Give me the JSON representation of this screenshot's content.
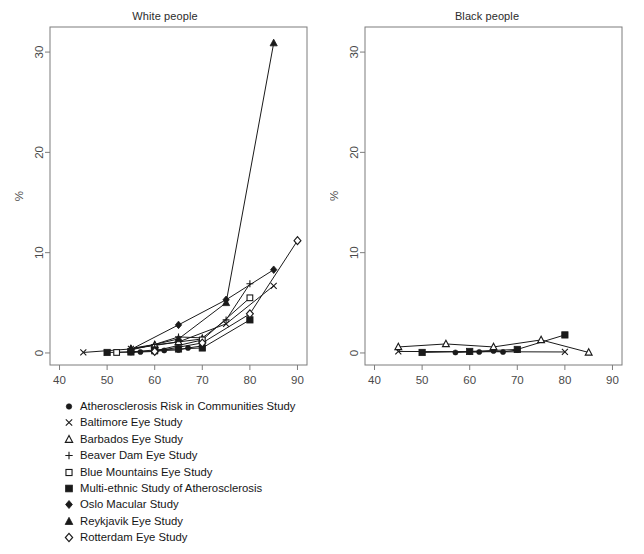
{
  "figure": {
    "caption_partial": "",
    "axis_color": "#7d7d7d",
    "line_color": "#1a1a1a",
    "background": "#ffffff"
  },
  "panels": [
    {
      "id": "white",
      "title": "White people"
    },
    {
      "id": "black",
      "title": "Black people"
    }
  ],
  "legend": {
    "items": [
      {
        "marker": "filled-circle-icon",
        "label": "Atherosclerosis Risk in Communities Study"
      },
      {
        "marker": "x-cross-icon",
        "label": "Baltimore Eye Study"
      },
      {
        "marker": "open-triangle-icon",
        "label": "Barbados Eye Study"
      },
      {
        "marker": "plus-icon",
        "label": "Beaver Dam Eye Study"
      },
      {
        "marker": "open-square-icon",
        "label": "Blue Mountains Eye Study"
      },
      {
        "marker": "filled-square-icon",
        "label": "Multi-ethnic Study of Atherosclerosis"
      },
      {
        "marker": "filled-diamond-icon",
        "label": "Oslo Macular Study"
      },
      {
        "marker": "filled-triangle-icon",
        "label": "Reykjavik Eye Study"
      },
      {
        "marker": "open-diamond-icon",
        "label": "Rotterdam Eye Study"
      }
    ]
  },
  "chart_data": [
    {
      "type": "line",
      "panel": "White people",
      "title": "White people",
      "xlabel": "",
      "ylabel": "%",
      "xlim": [
        38,
        92
      ],
      "ylim": [
        -1.2,
        32.5
      ],
      "xticks": [
        40,
        50,
        60,
        70,
        80,
        90
      ],
      "yticks": [
        0,
        10,
        20,
        30
      ],
      "grid": false,
      "legend_position": "below-figure",
      "series": [
        {
          "name": "Atherosclerosis Risk in Communities Study",
          "marker": "filled-circle",
          "x": [
            55,
            57,
            60,
            62,
            65,
            67,
            70
          ],
          "y": [
            0.05,
            0.1,
            0.15,
            0.25,
            0.3,
            0.5,
            0.7
          ]
        },
        {
          "name": "Baltimore Eye Study",
          "marker": "x-cross",
          "x": [
            45,
            55,
            65,
            75,
            85
          ],
          "y": [
            0.05,
            0.4,
            1.1,
            2.9,
            6.7
          ]
        },
        {
          "name": "Barbados Eye Study",
          "marker": "open-triangle",
          "x": [
            55,
            60,
            65,
            70
          ],
          "y": [
            0.4,
            0.8,
            1.1,
            1.4
          ]
        },
        {
          "name": "Beaver Dam Eye Study",
          "marker": "plus",
          "x": [
            55,
            60,
            65,
            70,
            75,
            80
          ],
          "y": [
            0.45,
            0.85,
            1.6,
            1.5,
            3.3,
            6.9
          ]
        },
        {
          "name": "Blue Mountains Eye Study",
          "marker": "open-square",
          "x": [
            52,
            60,
            70,
            80
          ],
          "y": [
            0.05,
            0.2,
            1.3,
            5.5
          ]
        },
        {
          "name": "Multi-ethnic Study of Atherosclerosis",
          "marker": "filled-square",
          "x": [
            50,
            55,
            60,
            65,
            70,
            80
          ],
          "y": [
            0.05,
            0.1,
            0.3,
            0.4,
            0.5,
            3.3
          ]
        },
        {
          "name": "Oslo Macular Study",
          "marker": "filled-diamond",
          "x": [
            55,
            65,
            75,
            85
          ],
          "y": [
            0.35,
            2.8,
            5.3,
            8.3
          ]
        },
        {
          "name": "Reykjavik Eye Study",
          "marker": "filled-triangle",
          "x": [
            55,
            65,
            75,
            85
          ],
          "y": [
            0.3,
            1.4,
            5.0,
            30.9
          ]
        },
        {
          "name": "Rotterdam Eye Study",
          "marker": "open-diamond",
          "x": [
            60,
            70,
            80,
            90
          ],
          "y": [
            0.15,
            1.0,
            3.9,
            11.2
          ]
        }
      ]
    },
    {
      "type": "line",
      "panel": "Black people",
      "title": "Black people",
      "xlabel": "",
      "ylabel": "%",
      "xlim": [
        38,
        92
      ],
      "ylim": [
        -1.2,
        32.5
      ],
      "xticks": [
        40,
        50,
        60,
        70,
        80,
        90
      ],
      "yticks": [
        0,
        10,
        20,
        30
      ],
      "grid": false,
      "legend_position": "below-figure",
      "series": [
        {
          "name": "Atherosclerosis Risk in Communities Study",
          "marker": "filled-circle",
          "x": [
            57,
            60,
            62,
            65,
            67,
            70
          ],
          "y": [
            0.05,
            0.1,
            0.1,
            0.2,
            0.1,
            0.3
          ]
        },
        {
          "name": "Baltimore Eye Study",
          "marker": "x-cross",
          "x": [
            45,
            80
          ],
          "y": [
            0.15,
            0.1
          ]
        },
        {
          "name": "Barbados Eye Study",
          "marker": "open-triangle",
          "x": [
            45,
            55,
            65,
            75,
            85
          ],
          "y": [
            0.6,
            0.9,
            0.6,
            1.3,
            0.05
          ]
        },
        {
          "name": "Multi-ethnic Study of Atherosclerosis",
          "marker": "filled-square",
          "x": [
            50,
            60,
            70,
            80
          ],
          "y": [
            0.05,
            0.15,
            0.35,
            1.8
          ]
        }
      ]
    }
  ]
}
